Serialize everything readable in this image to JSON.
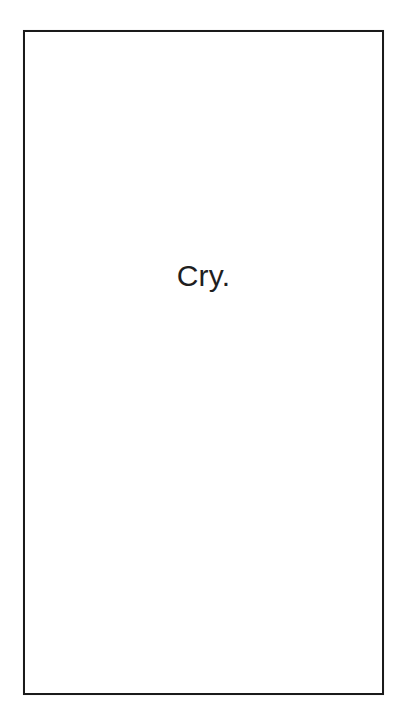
{
  "document": {
    "background_color": "#ffffff",
    "page": {
      "border_color": "#1a1a1a",
      "border_width_px": 2,
      "fill_color": "#ffffff",
      "body_text": "Cry.",
      "text_color": "#1f1f1f",
      "text_align": "center",
      "font_size_px": 30
    }
  }
}
